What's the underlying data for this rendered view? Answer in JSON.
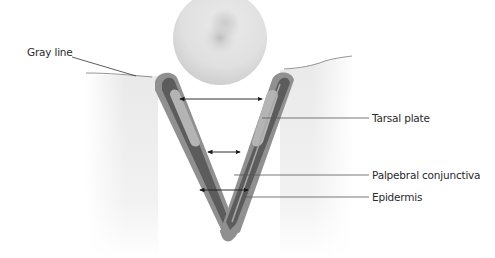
{
  "diagram": {
    "labels": [
      {
        "id": "gray-line",
        "text": "Gray line"
      },
      {
        "id": "tarsal-plate",
        "text": "Tarsal plate"
      },
      {
        "id": "palpebral-conjunctiva",
        "text": "Palpebral conjunctiva"
      },
      {
        "id": "epidermis",
        "text": "Epidermis"
      }
    ],
    "colors": {
      "background": "#ffffff",
      "skin_fill": "#ececec",
      "outer_layer": "#8f8f8f",
      "middle_layer": "#5c5c5c",
      "inner_layer": "#a8a8a8",
      "tarsal_plate": "#b9b9b9",
      "eyeball": "#d9d9d9",
      "leader_line": "#444444",
      "text": "#2a2a2a"
    }
  }
}
